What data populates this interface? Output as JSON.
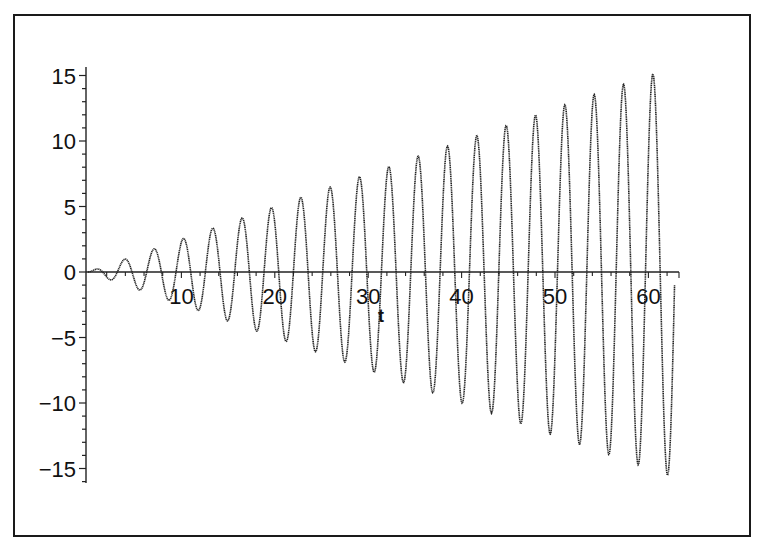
{
  "chart_data": {
    "type": "line",
    "title": "",
    "xlabel": "t",
    "ylabel": "",
    "function_description": "y = (t/4)·sin(2t), oscillation with linearly growing amplitude",
    "xlim": [
      0,
      62.83
    ],
    "ylim": [
      -16,
      16
    ],
    "x_ticks": [
      10,
      20,
      30,
      40,
      50,
      60
    ],
    "x_tick_labels": [
      "10",
      "20",
      "30",
      "40",
      "50",
      "60"
    ],
    "y_ticks": [
      15,
      10,
      5,
      0,
      -5,
      -10,
      -15
    ],
    "y_tick_labels": [
      "15",
      "10",
      "5",
      "0",
      "−5",
      "−10",
      "−15"
    ],
    "grid": false,
    "legend": null,
    "series": [
      {
        "name": "y(t)",
        "color": "#222222",
        "sample_step": 0.05,
        "amplitude_slope": 0.25,
        "angular_frequency": 2,
        "peaks": [
          {
            "t": 0.8,
            "y": 0.2
          },
          {
            "t": 3.9,
            "y": 1.0
          },
          {
            "t": 7.1,
            "y": 1.8
          },
          {
            "t": 10.2,
            "y": 2.6
          },
          {
            "t": 13.4,
            "y": 3.3
          },
          {
            "t": 16.5,
            "y": 4.1
          },
          {
            "t": 19.6,
            "y": 4.9
          },
          {
            "t": 22.8,
            "y": 5.7
          },
          {
            "t": 25.9,
            "y": 6.5
          },
          {
            "t": 29.1,
            "y": 7.3
          },
          {
            "t": 32.2,
            "y": 8.0
          },
          {
            "t": 35.3,
            "y": 8.8
          },
          {
            "t": 38.5,
            "y": 9.6
          },
          {
            "t": 41.6,
            "y": 10.4
          },
          {
            "t": 44.8,
            "y": 11.2
          },
          {
            "t": 47.9,
            "y": 12.0
          },
          {
            "t": 51.1,
            "y": 12.8
          },
          {
            "t": 54.2,
            "y": 13.5
          },
          {
            "t": 57.3,
            "y": 14.3
          },
          {
            "t": 60.5,
            "y": 15.1
          }
        ],
        "troughs": [
          {
            "t": 2.4,
            "y": -0.6
          },
          {
            "t": 5.5,
            "y": -1.4
          },
          {
            "t": 8.6,
            "y": -2.2
          },
          {
            "t": 11.8,
            "y": -2.9
          },
          {
            "t": 14.9,
            "y": -3.7
          },
          {
            "t": 18.1,
            "y": -4.5
          },
          {
            "t": 21.2,
            "y": -5.3
          },
          {
            "t": 24.3,
            "y": -6.1
          },
          {
            "t": 27.5,
            "y": -6.9
          },
          {
            "t": 30.6,
            "y": -7.7
          },
          {
            "t": 33.8,
            "y": -8.4
          },
          {
            "t": 36.9,
            "y": -9.2
          },
          {
            "t": 40.1,
            "y": -10.0
          },
          {
            "t": 43.2,
            "y": -10.8
          },
          {
            "t": 46.3,
            "y": -11.6
          },
          {
            "t": 49.5,
            "y": -12.4
          },
          {
            "t": 52.6,
            "y": -13.2
          },
          {
            "t": 55.8,
            "y": -13.9
          },
          {
            "t": 58.9,
            "y": -14.7
          },
          {
            "t": 62.0,
            "y": -15.5
          }
        ]
      }
    ]
  },
  "layout": {
    "x0_px": 88,
    "x_px_per_unit": 9.34,
    "y0_px": 272,
    "y_px_per_unit": 13.1,
    "yaxis_x_px": 86,
    "yaxis_top_px": 67,
    "yaxis_bottom_px": 483,
    "xaxis_end_px": 679,
    "xlabel_pos": [
      381,
      322
    ]
  }
}
